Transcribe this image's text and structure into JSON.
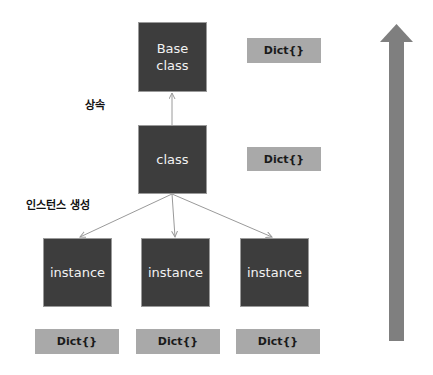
{
  "diagram": {
    "nodes": {
      "base_class": "Base\nclass",
      "class": "class",
      "instances": [
        "instance",
        "instance",
        "instance"
      ]
    },
    "dicts": {
      "base_class_dict": "Dict{}",
      "class_dict": "Dict{}",
      "instance_dicts": [
        "Dict{}",
        "Dict{}",
        "Dict{}"
      ]
    },
    "labels": {
      "inheritance": "상속",
      "instance_creation": "인스턴스 생성"
    },
    "colors": {
      "node_fill": "#3d3d3d",
      "dict_fill": "#a9a9a9",
      "arrow_fill": "#7f7f7f",
      "connector": "#9a9a9a"
    }
  }
}
